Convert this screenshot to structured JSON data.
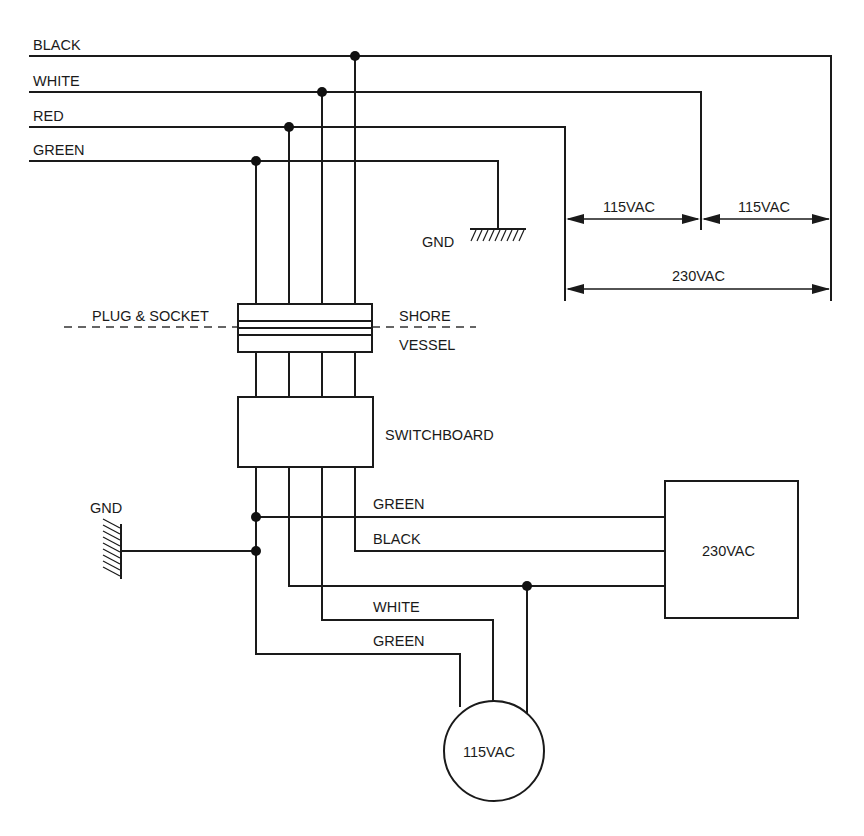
{
  "diagram": {
    "shore_wires": {
      "black": "BLACK",
      "white": "WHITE",
      "red": "RED",
      "green": "GREEN"
    },
    "shore_ground_label": "GND",
    "dimensions": {
      "left_115": "115VAC",
      "right_115": "115VAC",
      "total_230": "230VAC"
    },
    "plug_socket_label": "PLUG & SOCKET",
    "shore_side_label": "SHORE",
    "vessel_side_label": "VESSEL",
    "switchboard_label": "SWITCHBOARD",
    "vessel_ground_label": "GND",
    "load_230": {
      "label": "230VAC",
      "wire_green": "GREEN",
      "wire_black": "BLACK"
    },
    "load_115": {
      "label": "115VAC",
      "wire_white": "WHITE",
      "wire_green": "GREEN"
    },
    "colors": {
      "line": "#1a1a1a",
      "background": "#ffffff"
    }
  }
}
